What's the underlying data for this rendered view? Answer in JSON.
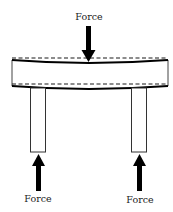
{
  "diagram": {
    "type": "beam-on-two-supports-under-load",
    "labels": {
      "top_force": "Force",
      "left_support_force": "Force",
      "right_support_force": "Force"
    },
    "elements": {
      "beam": {
        "x": 12,
        "y": 58,
        "width": 156,
        "height": 30,
        "deflected": true
      },
      "left_column": {
        "x": 30,
        "y": 88,
        "width": 16,
        "height": 64
      },
      "right_column": {
        "x": 131,
        "y": 88,
        "width": 16,
        "height": 64
      },
      "top_arrow": {
        "x": 88.5,
        "y_start": 26,
        "y_end": 62,
        "direction": "down"
      },
      "left_arrow": {
        "x": 38.5,
        "y_start": 191,
        "y_end": 154,
        "direction": "up"
      },
      "right_arrow": {
        "x": 139.5,
        "y_start": 191,
        "y_end": 154,
        "direction": "up"
      }
    },
    "colors": {
      "stroke": "#1a1a1a",
      "arrow": "#000000",
      "background": "#ffffff"
    }
  }
}
